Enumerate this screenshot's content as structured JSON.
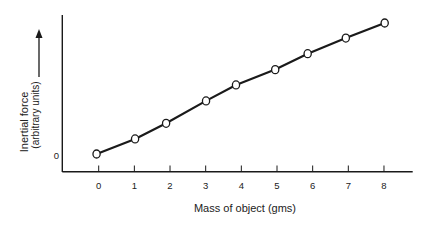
{
  "chart_data": {
    "type": "line",
    "title": "",
    "xlabel": "Mass of object (gms)",
    "ylabel": "Inertial force",
    "ylabel_sub": "(arbitrary units)",
    "ylabel_arrow": "up-arrow",
    "x": [
      0,
      1,
      2,
      3,
      4,
      5,
      6,
      7,
      8
    ],
    "x_ticks": [
      "0",
      "1",
      "2",
      "3",
      "4",
      "5",
      "6",
      "7",
      "8"
    ],
    "y_ticks": [
      "0"
    ],
    "series": [
      {
        "name": "Inertial force vs mass",
        "marker": "open-circle",
        "x_plotted": [
          -0.06,
          1.02,
          1.89,
          3.01,
          3.85,
          4.95,
          5.86,
          6.93,
          8.02
        ],
        "values": [
          0,
          1.15,
          2.34,
          4.05,
          5.27,
          6.44,
          7.66,
          8.85,
          10.0
        ]
      }
    ],
    "xlim": [
      -1,
      8.8
    ],
    "ylim": [
      -1.35,
      10.5
    ],
    "grid": false,
    "legend": "none",
    "colors": {
      "line": "#1a1a1a",
      "marker_fill": "#ffffff",
      "axis": "#1a1a1a"
    }
  }
}
